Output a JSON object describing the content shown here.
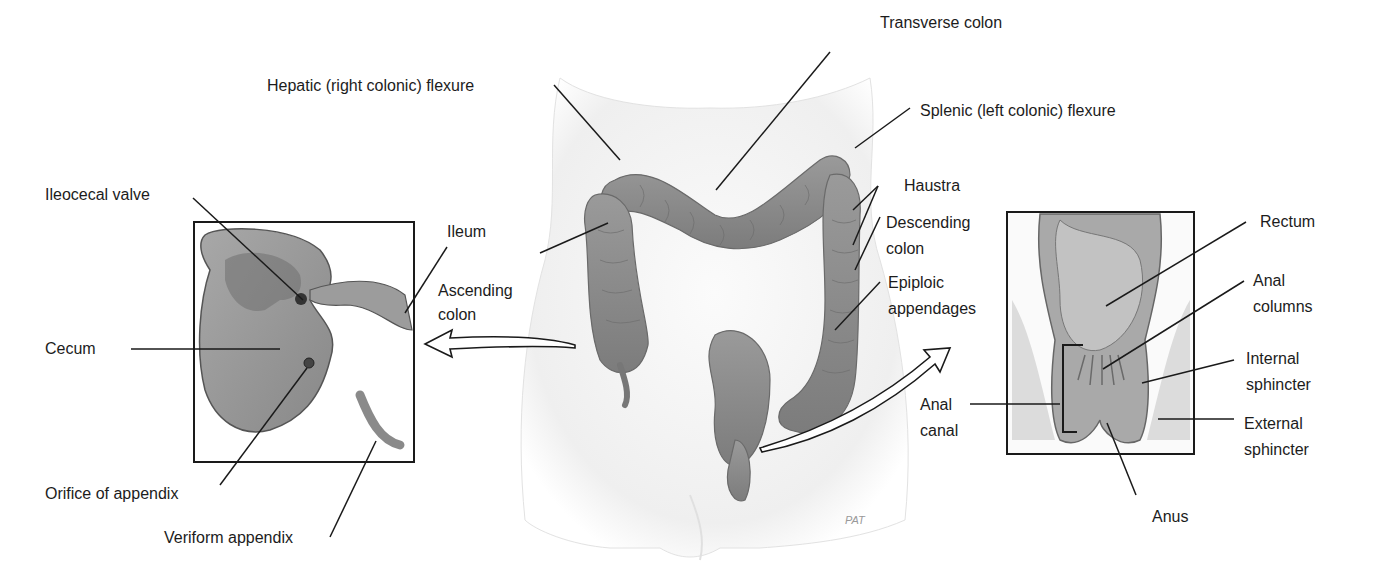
{
  "figure": {
    "center_labels": {
      "transverse_colon": "Transverse colon",
      "hepatic_flexure": "Hepatic (right colonic) flexure",
      "splenic_flexure": "Splenic (left colonic) flexure",
      "haustra": "Haustra",
      "descending_colon_1": "Descending",
      "descending_colon_2": "colon",
      "epiploic_1": "Epiploic",
      "epiploic_2": "appendages",
      "ascending_1": "Ascending",
      "ascending_2": "colon",
      "artist_signature": "PAT"
    },
    "left_inset": {
      "title": "Cecum detail",
      "labels": {
        "ileocecal_valve": "Ileocecal valve",
        "ileum": "Ileum",
        "cecum": "Cecum",
        "orifice": "Orifice of appendix",
        "appendix": "Veriform appendix"
      }
    },
    "right_inset": {
      "title": "Rectum detail",
      "labels": {
        "rectum": "Rectum",
        "anal_columns_1": "Anal",
        "anal_columns_2": "columns",
        "internal_1": "Internal",
        "internal_2": "sphincter",
        "external_1": "External",
        "external_2": "sphincter",
        "anal_canal_1": "Anal",
        "anal_canal_2": "canal",
        "anus": "Anus"
      }
    },
    "colors": {
      "line": "#1a1a1a",
      "tissue": "#8f8f8f",
      "tissue_light": "#b8b8b8",
      "body": "#f0f0f0"
    }
  }
}
